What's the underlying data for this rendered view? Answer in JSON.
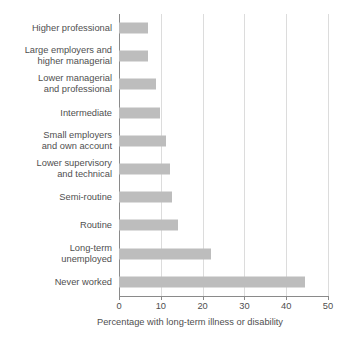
{
  "chart_data": {
    "type": "bar",
    "orientation": "horizontal",
    "title": "",
    "subtitle": "",
    "xlabel": "Percentage with long-term illness or disability",
    "ylabel": "",
    "xlim": [
      0,
      50
    ],
    "xticks": [
      0,
      10,
      20,
      30,
      40,
      50
    ],
    "xtick_labels": [
      "0",
      "10",
      "20",
      "30",
      "40",
      "50"
    ],
    "grid": "vertical",
    "legend": "none",
    "bar_color": "#bdbdbd",
    "gridline_color": "#dcdcdc",
    "axis_color": "#8a8a8a",
    "text_color": "#4f4f4f",
    "categories": [
      "Higher professional",
      "Large employers and\nhigher managerial",
      "Lower managerial\nand professional",
      "Intermediate",
      "Small employers\nand own account",
      "Lower supervisory\nand technical",
      "Semi-routine",
      "Routine",
      "Long-term\nunemployed",
      "Never worked"
    ],
    "values": [
      7,
      7,
      8.9,
      9.8,
      11.2,
      12.2,
      12.7,
      14.1,
      22,
      44.5
    ]
  }
}
